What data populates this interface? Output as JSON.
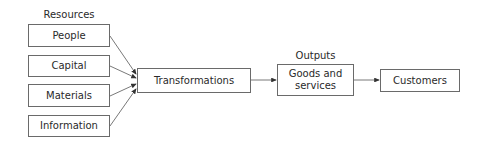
{
  "diagram": {
    "resources_label": "Resources",
    "outputs_label": "Outputs",
    "resources": [
      {
        "label": "People"
      },
      {
        "label": "Capital"
      },
      {
        "label": "Materials"
      },
      {
        "label": "Information"
      }
    ],
    "transformations": {
      "label": "Transformations"
    },
    "goods": {
      "line1": "Goods and",
      "line2": "services"
    },
    "customers": {
      "label": "Customers"
    }
  }
}
